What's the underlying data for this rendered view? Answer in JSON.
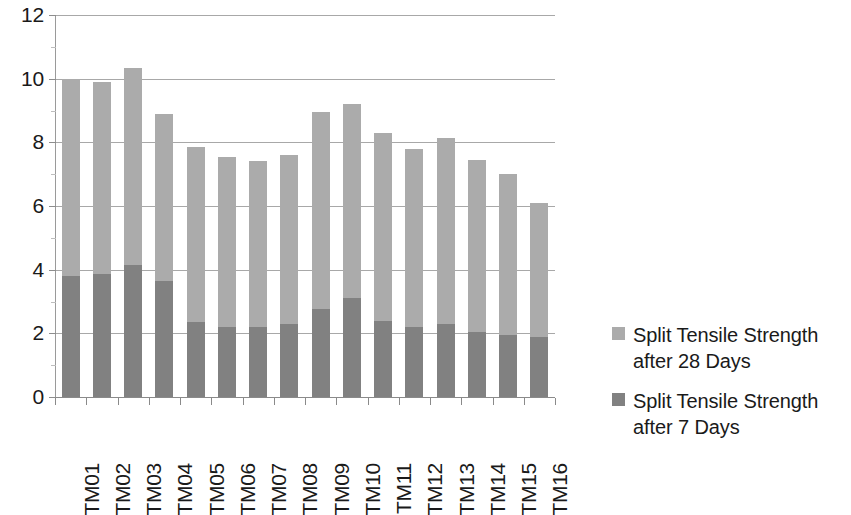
{
  "chart_data": {
    "type": "bar",
    "stacked": true,
    "title": "",
    "xlabel": "",
    "ylabel": "",
    "ylim": [
      0,
      12
    ],
    "y_ticks": [
      0,
      2,
      4,
      6,
      8,
      10,
      12
    ],
    "y_tick_labels": [
      "0",
      "2",
      "4",
      "6",
      "8",
      "10",
      "12"
    ],
    "grid": true,
    "legend_position": "right",
    "categories": [
      "TM01",
      "TM02",
      "TM03",
      "TM04",
      "TM05",
      "TM06",
      "TM07",
      "TM08",
      "TM09",
      "TM10",
      "TM11",
      "TM12",
      "TM13",
      "TM14",
      "TM15",
      "TM16"
    ],
    "series": [
      {
        "name": "Split Tensile Strength after 7 Days",
        "color": "#818181",
        "values": [
          3.8,
          3.85,
          4.15,
          3.65,
          2.35,
          2.2,
          2.2,
          2.3,
          2.75,
          3.1,
          2.4,
          2.2,
          2.3,
          2.05,
          1.95,
          1.9
        ]
      },
      {
        "name": "Split Tensile Strength after 28 Days",
        "color": "#ababab",
        "values": [
          10.0,
          9.9,
          10.35,
          8.9,
          7.85,
          7.55,
          7.4,
          7.6,
          8.95,
          9.2,
          8.3,
          7.8,
          8.15,
          7.45,
          7.0,
          6.1
        ]
      }
    ]
  },
  "legend": {
    "items": [
      {
        "label": "Split Tensile Strength after 28 Days",
        "color": "#ababab"
      },
      {
        "label": "Split Tensile Strength after 7 Days",
        "color": "#818181"
      }
    ]
  }
}
